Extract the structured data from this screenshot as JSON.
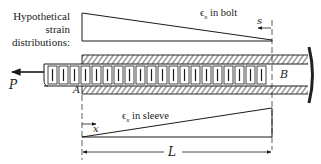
{
  "diagram": {
    "caption_lines": [
      "Hypothetical",
      "strain",
      "distributions:"
    ],
    "bolt_strain_label": {
      "symbol": "ϵ",
      "subscript": "x",
      "text": " in bolt"
    },
    "sleeve_strain_label": {
      "symbol": "ϵ",
      "subscript": "x",
      "text": " in sleeve"
    },
    "labels": {
      "s": "s",
      "x": "x",
      "P": "P",
      "A": "A",
      "B": "B",
      "L": "L"
    },
    "colors": {
      "line": "#1a1a1a",
      "background": "#ffffff",
      "wall": "#222222"
    }
  }
}
